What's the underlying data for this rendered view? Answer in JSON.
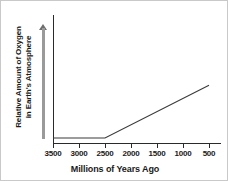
{
  "chart_data": {
    "type": "line",
    "title": "",
    "xlabel": "Millions of Years Ago",
    "ylabel_line1": "Relative Amount of Oxygen",
    "ylabel_line2": "in Earth's Atmosphere",
    "xticks": [
      "3500",
      "3000",
      "2500",
      "2000",
      "1500",
      "1000",
      "500"
    ],
    "xlim": [
      3500,
      500
    ],
    "ylim": [
      0,
      1
    ],
    "yticks": [],
    "grid": false,
    "legend": null,
    "axis_arrow": "up-arrow",
    "line_color": "#3a3a3a",
    "arrow_color": "#9a9a9a",
    "series": [
      {
        "name": "Relative Amount of Oxygen in Earth's Atmosphere",
        "x": [
          3500,
          2500,
          500
        ],
        "values": [
          0,
          0,
          0.45
        ],
        "description": "Flat at zero from 3500 to 2500 million years ago, then rising linearly to 500 million years ago"
      }
    ]
  }
}
